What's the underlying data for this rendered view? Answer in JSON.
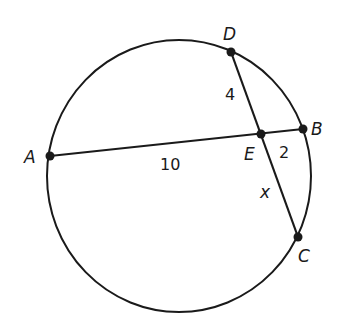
{
  "diagram": {
    "type": "intersecting-chords-in-circle",
    "circle": {
      "cx": 179,
      "cy": 176,
      "rx": 132,
      "ry": 136
    },
    "points": {
      "A": {
        "label": "A",
        "x": 50,
        "y": 156
      },
      "B": {
        "label": "B",
        "x": 303,
        "y": 129
      },
      "C": {
        "label": "C",
        "x": 298,
        "y": 237
      },
      "D": {
        "label": "D",
        "x": 231,
        "y": 52
      },
      "E": {
        "label": "E",
        "x": 261,
        "y": 134
      }
    },
    "segments": [
      {
        "from": "A",
        "to": "B",
        "name": "chord-AB"
      },
      {
        "from": "D",
        "to": "C",
        "name": "chord-DC"
      }
    ],
    "measures": {
      "AE": "10",
      "EB": "2",
      "DE": "4",
      "EC": "x"
    },
    "colors": {
      "stroke": "#1a1a1a",
      "background": "#ffffff"
    }
  }
}
